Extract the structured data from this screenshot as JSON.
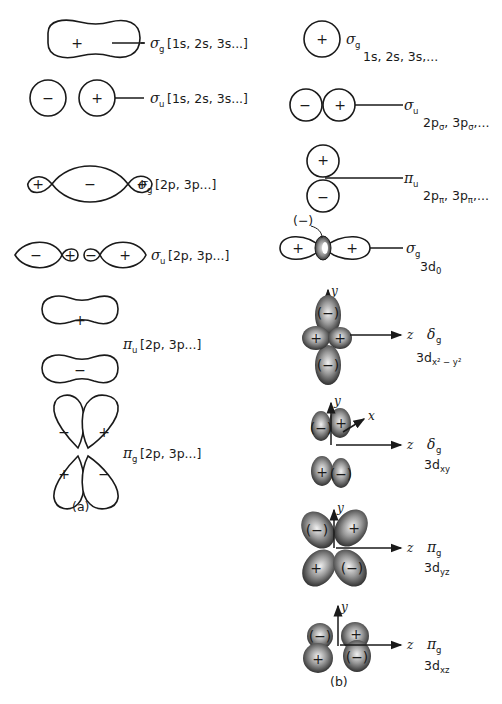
{
  "figure": {
    "panel_a": {
      "caption": "(a)",
      "rows": [
        {
          "symbol": "σ",
          "sub": "g",
          "label": "[1s, 2s, 3s...]",
          "signs": [
            "+"
          ]
        },
        {
          "symbol": "σ",
          "sub": "u",
          "label": "[1s, 2s, 3s...]",
          "signs": [
            "−",
            "+"
          ]
        },
        {
          "symbol": "σ",
          "sub": "g",
          "label": "[2p, 3p...]",
          "signs": [
            "+",
            "−",
            "+"
          ]
        },
        {
          "symbol": "σ",
          "sub": "u",
          "label": "[2p, 3p...]",
          "signs": [
            "−",
            "+",
            "−",
            "+"
          ]
        },
        {
          "symbol": "π",
          "sub": "u",
          "label": "[2p, 3p...]",
          "signs": [
            "+",
            "−"
          ]
        },
        {
          "symbol": "π",
          "sub": "g",
          "label": "[2p, 3p...]",
          "signs": [
            "−",
            "+",
            "+",
            "−"
          ]
        }
      ]
    },
    "panel_b": {
      "caption": "(b)",
      "rows": [
        {
          "symbol": "σ",
          "sub": "g",
          "orbital": "1s, 2s, 3s,...",
          "signs": [
            "+"
          ]
        },
        {
          "symbol": "σ",
          "sub": "u",
          "orbital": "2p",
          "orb_sub": "σ",
          "orbital_rest": ", 3p",
          "orb_sub2": "σ",
          "orbital_tail": ",...",
          "signs": [
            "−",
            "+"
          ]
        },
        {
          "symbol": "π",
          "sub": "u",
          "orbital": "2p",
          "orb_sub": "π",
          "orbital_rest": ", 3p",
          "orb_sub2": "π",
          "orbital_tail": ",...",
          "signs": [
            "+",
            "−"
          ]
        },
        {
          "symbol": "σ",
          "sub": "g",
          "orbital": "3d",
          "orb_sub": "0",
          "signs": [
            "+",
            "+"
          ],
          "annotation": "(−)"
        },
        {
          "symbol": "δ",
          "sub": "g",
          "orbital": "3d",
          "orb_sub": "x² − y²",
          "signs": [
            "(−)",
            "+",
            "+",
            "(−)"
          ],
          "axes": [
            "y",
            "z"
          ]
        },
        {
          "symbol": "δ",
          "sub": "g",
          "orbital": "3d",
          "orb_sub": "xy",
          "signs": [
            "(−)",
            "+",
            "+",
            "(−)"
          ],
          "axes": [
            "y",
            "x",
            "z"
          ]
        },
        {
          "symbol": "π",
          "sub": "g",
          "orbital": "3d",
          "orb_sub": "yz",
          "signs": [
            "(−)",
            "+",
            "+",
            "(−)"
          ],
          "axes": [
            "y",
            "z"
          ]
        },
        {
          "symbol": "π",
          "sub": "g",
          "orbital": "3d",
          "orb_sub": "xz",
          "signs": [
            "(−)",
            "+",
            "+",
            "(−)"
          ],
          "axes": [
            "y",
            "z"
          ]
        }
      ]
    },
    "colors": {
      "ink": "#1a1a1a",
      "shade_dark": "#2a2a2a",
      "shade_light": "#d8d8d8"
    }
  }
}
